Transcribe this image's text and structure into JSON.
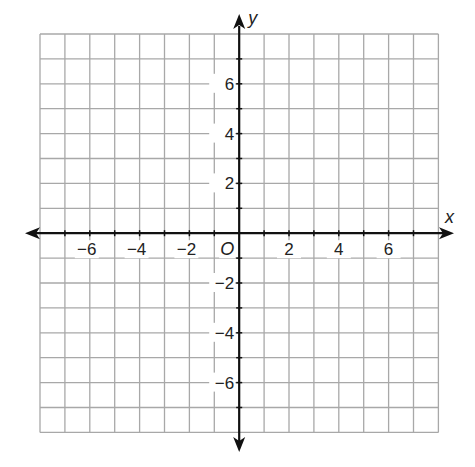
{
  "chart_data": {
    "type": "scatter",
    "title": "",
    "xlabel": "x",
    "ylabel": "y",
    "origin_label": "O",
    "xlim": [
      -8,
      8
    ],
    "ylim": [
      -8,
      8
    ],
    "grid": true,
    "grid_step": 1,
    "x_ticks": [
      -6,
      -4,
      -2,
      2,
      4,
      6
    ],
    "y_ticks": [
      6,
      4,
      2,
      -2,
      -4,
      -6
    ],
    "x_tick_labels": [
      "−6",
      "−4",
      "−2",
      "2",
      "4",
      "6"
    ],
    "y_tick_labels": [
      "6",
      "4",
      "2",
      "−2",
      "−4",
      "−6"
    ],
    "series": [],
    "legend": null
  },
  "layout": {
    "grid_left": 40,
    "grid_top": 34,
    "cell": 24.9,
    "cells": 16,
    "colors": {
      "grid": "#a8a8a8",
      "axis": "#111111",
      "text": "#222222"
    }
  }
}
